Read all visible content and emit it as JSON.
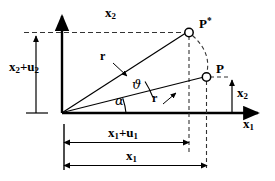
{
  "figure": {
    "type": "geometry-diagram",
    "axes": {
      "vertical_label": "x",
      "vertical_sub": "2",
      "horizontal_label": "x",
      "horizontal_sub": "1"
    },
    "points": [
      {
        "id": "P-star",
        "label": "P",
        "sup": "*",
        "marker": "open-circle",
        "x": 189,
        "y": 32
      },
      {
        "id": "P",
        "label": "P",
        "sup": "",
        "marker": "open-circle",
        "x": 206,
        "y": 77
      }
    ],
    "rays": [
      {
        "id": "ray-to-P-star",
        "from": "origin",
        "to": "P-star",
        "label": "r"
      },
      {
        "id": "ray-to-P",
        "from": "origin",
        "to": "P",
        "label": "r"
      }
    ],
    "angles": [
      {
        "id": "angle-alpha",
        "symbol": "α",
        "between": [
          "x1-axis",
          "ray-to-P"
        ]
      },
      {
        "id": "angle-theta",
        "symbol": "ϑ",
        "between": [
          "ray-to-P",
          "ray-to-P-star"
        ]
      }
    ],
    "dimensions": [
      {
        "id": "dim-x2-plus-u2",
        "orientation": "vertical",
        "base": "x",
        "base_sub": "2",
        "plus": "+",
        "term": "u",
        "term_sub": "2"
      },
      {
        "id": "dim-x2",
        "orientation": "vertical",
        "base": "x",
        "base_sub": "2",
        "plus": "",
        "term": "",
        "term_sub": ""
      },
      {
        "id": "dim-x1-plus-u1",
        "orientation": "horizontal",
        "base": "x",
        "base_sub": "1",
        "plus": "+",
        "term": "u",
        "term_sub": "1"
      },
      {
        "id": "dim-x1",
        "orientation": "horizontal",
        "base": "x",
        "base_sub": "1",
        "plus": "",
        "term": "",
        "term_sub": ""
      }
    ],
    "labels": {
      "x2_axis": "x",
      "x2_axis_sub": "2",
      "x1_axis": "x",
      "x1_axis_sub": "1",
      "x2_plus_u2_main": "x",
      "x2_plus_u2_main_sub": "2",
      "x2_plus_u2_op": "+",
      "x2_plus_u2_term": "u",
      "x2_plus_u2_term_sub": "2",
      "x1_plus_u1_main": "x",
      "x1_plus_u1_main_sub": "1",
      "x1_plus_u1_op": "+",
      "x1_plus_u1_term": "u",
      "x1_plus_u1_term_sub": "1",
      "x1_dim": "x",
      "x1_dim_sub": "1",
      "x2_dim_right": "x",
      "x2_dim_right_sub": "2",
      "r_upper": "r",
      "r_lower": "r",
      "alpha": "α",
      "theta": "ϑ",
      "p_star_letter": "P",
      "p_star_mark": "*",
      "p_letter": "P"
    },
    "colors": {
      "stroke": "#000000",
      "background": "#ffffff",
      "dashed": "#444444"
    }
  }
}
